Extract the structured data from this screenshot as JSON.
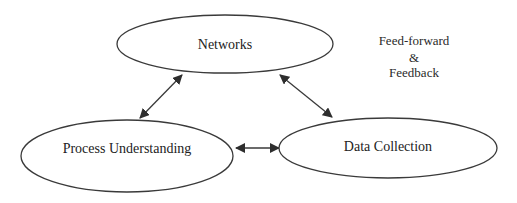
{
  "diagram": {
    "type": "cycle-network",
    "colors": {
      "stroke": "#3a3a3a",
      "text": "#222222",
      "background": "#ffffff"
    },
    "nodes": [
      {
        "id": "networks",
        "label": "Networks",
        "shape": "ellipse",
        "cx": 225,
        "cy": 44,
        "rx": 108,
        "ry": 29
      },
      {
        "id": "process_understanding",
        "label": "Process Understanding",
        "shape": "ellipse",
        "cx": 127,
        "cy": 156,
        "rx": 106,
        "ry": 36
      },
      {
        "id": "data_collection",
        "label": "Data Collection",
        "shape": "ellipse",
        "cx": 388,
        "cy": 148,
        "rx": 109,
        "ry": 30
      }
    ],
    "edges": [
      {
        "from": "networks",
        "to": "process_understanding",
        "direction": "bidirectional"
      },
      {
        "from": "networks",
        "to": "data_collection",
        "direction": "bidirectional"
      },
      {
        "from": "process_understanding",
        "to": "data_collection",
        "direction": "bidirectional"
      }
    ],
    "annotation": {
      "line1": "Feed-forward",
      "line2": "&",
      "line3": "Feedback"
    }
  }
}
